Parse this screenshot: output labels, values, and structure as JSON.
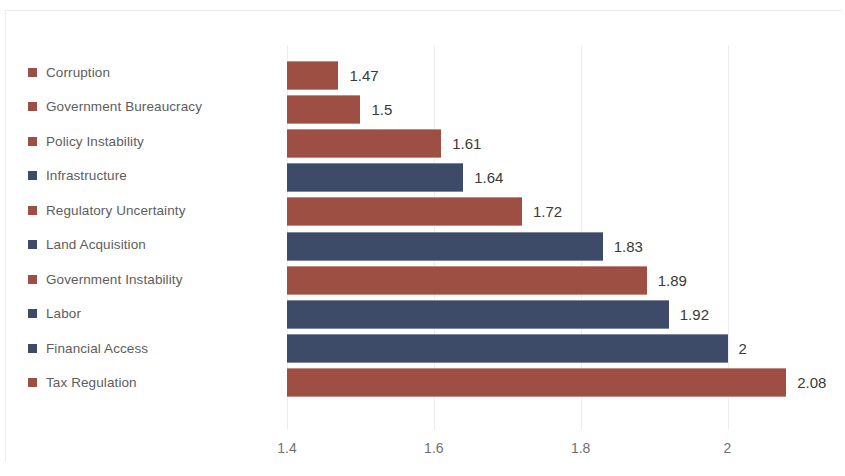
{
  "chart_data": {
    "type": "bar",
    "orientation": "horizontal",
    "title": "",
    "subtitle": "",
    "xlabel": "",
    "ylabel": "",
    "xlim": [
      1.4,
      2.16
    ],
    "axis_start_value": 1.4,
    "xticks": [
      "1.4",
      "1.6",
      "1.8",
      "2"
    ],
    "xtick_values": [
      1.4,
      1.6,
      1.8,
      2.0
    ],
    "grid": true,
    "legend_position": "left",
    "categories": [
      "Corruption",
      "Government Bureaucracy",
      "Policy Instability",
      "Infrastructure",
      "Regulatory Uncertainty",
      "Land Acquisition",
      "Government Instability",
      "Labor",
      "Financial Access",
      "Tax Regulation"
    ],
    "values": [
      1.47,
      1.5,
      1.61,
      1.64,
      1.72,
      1.83,
      1.89,
      1.92,
      2,
      2.08
    ],
    "value_labels": [
      "1.47",
      "1.5",
      "1.61",
      "1.64",
      "1.72",
      "1.83",
      "1.89",
      "1.92",
      "2",
      "2.08"
    ],
    "colors": [
      "#9e4f43",
      "#9e4f43",
      "#9e4f43",
      "#3d4a68",
      "#9e4f43",
      "#3d4a68",
      "#9e4f43",
      "#3d4a68",
      "#3d4a68",
      "#9e4f43"
    ],
    "palette": {
      "red": "#9e4f43",
      "blue": "#3d4a68",
      "gridline": "#ededed",
      "label_text": "#3a3a3a",
      "legend_text": "#5d5d5d",
      "tick_text": "#707070",
      "background": "#ffffff"
    }
  }
}
